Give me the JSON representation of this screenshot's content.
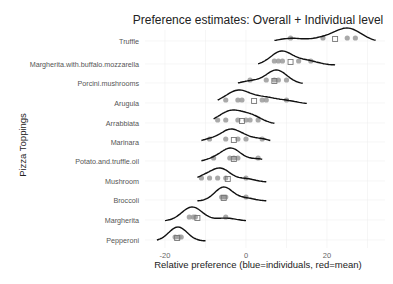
{
  "chart_data": {
    "type": "ridgeline",
    "title": "Preference estimates: Overall + Individual level",
    "xlabel": "Relative preference (blue=individuals, red=mean)",
    "ylabel": "Pizza Toppings",
    "xticks": [
      -20,
      0,
      20
    ],
    "xlim": [
      -25,
      32
    ],
    "grid": true,
    "legend": null,
    "categories": [
      "Truffle",
      "Margherita.with.buffalo.mozzarella",
      "Porcini.mushrooms",
      "Arugula",
      "Arrabbiata",
      "Marinara",
      "Potato.and.truffle.oil",
      "Mushroom",
      "Broccoli",
      "Margherita",
      "Pepperoni"
    ],
    "series": [
      {
        "name": "Truffle",
        "mean": 22,
        "individuals": [
          11,
          19,
          25,
          27
        ],
        "range": [
          7,
          32
        ],
        "peak": 24.5
      },
      {
        "name": "Margherita.with.buffalo.mozzarella",
        "mean": 11,
        "individuals": [
          7,
          8,
          9,
          13,
          16
        ],
        "range": [
          3,
          22
        ],
        "peak": 9.5
      },
      {
        "name": "Porcini.mushrooms",
        "mean": 7,
        "individuals": [
          1,
          5,
          7,
          8,
          10
        ],
        "range": [
          -2,
          14
        ],
        "peak": 7.5
      },
      {
        "name": "Arugula",
        "mean": 2,
        "individuals": [
          -5,
          -2,
          -1,
          4,
          5,
          10
        ],
        "range": [
          -7,
          15
        ],
        "peak": -1.5
      },
      {
        "name": "Arrabbiata",
        "mean": -1,
        "individuals": [
          -7,
          -5,
          -2,
          0,
          1,
          3
        ],
        "range": [
          -8,
          7
        ],
        "peak": -3.5
      },
      {
        "name": "Marinara",
        "mean": -3,
        "individuals": [
          -9,
          -5,
          -2,
          0,
          4
        ],
        "range": [
          -11,
          6
        ],
        "peak": -4
      },
      {
        "name": "Potato.and.truffle.oil",
        "mean": -3,
        "individuals": [
          -8,
          -4,
          -3,
          -2,
          3
        ],
        "range": [
          -11,
          4
        ],
        "peak": -4.5
      },
      {
        "name": "Mushroom",
        "mean": -4.5,
        "individuals": [
          -11,
          -9,
          -7,
          -5,
          0
        ],
        "range": [
          -12,
          5
        ],
        "peak": -6
      },
      {
        "name": "Broccoli",
        "mean": -5.5,
        "individuals": [
          -6,
          -5.5,
          -5,
          0
        ],
        "range": [
          -12,
          5
        ],
        "peak": -5.5
      },
      {
        "name": "Margherita",
        "mean": -12,
        "individuals": [
          -14,
          -13,
          -12.5,
          -5
        ],
        "range": [
          -20,
          0
        ],
        "peak": -13.5
      },
      {
        "name": "Pepperoni",
        "mean": -17,
        "individuals": [
          -17.5,
          -16.5,
          -16
        ],
        "range": [
          -22,
          -10
        ],
        "peak": -17
      }
    ]
  }
}
